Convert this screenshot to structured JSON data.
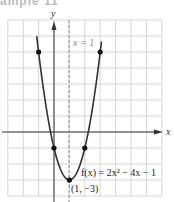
{
  "header_fragment": "ample 11",
  "chart_data": {
    "type": "line",
    "title": "",
    "xlabel": "x",
    "ylabel": "y",
    "xlim": [
      -3,
      7
    ],
    "ylim": [
      -4,
      7
    ],
    "grid": true,
    "series": [
      {
        "name": "f(x) = 2x^2 - 4x - 1",
        "function": "2x^2 - 4x - 1",
        "x": [
          -1.1,
          -1,
          0,
          1,
          2,
          3,
          3.1
        ],
        "y": [
          5.62,
          5,
          -1,
          -3,
          -1,
          5,
          5.82
        ]
      }
    ],
    "marked_points": [
      {
        "x": -1,
        "y": 5
      },
      {
        "x": 0,
        "y": -1
      },
      {
        "x": 1,
        "y": -3
      },
      {
        "x": 2,
        "y": -1
      },
      {
        "x": 3,
        "y": 5
      }
    ],
    "axis_of_symmetry": {
      "x": 1,
      "label": "x = 1",
      "style": "dashed"
    },
    "annotations": [
      {
        "text": "f(x) = 2x² − 4x − 1",
        "near": {
          "x": 1.3,
          "y": -2.4
        }
      },
      {
        "text": "(1, −3)",
        "near": {
          "x": 1,
          "y": -3.6
        }
      },
      {
        "text": "x = 1",
        "near": {
          "x": 1.6,
          "y": 5.6
        }
      }
    ],
    "colors": {
      "curve": "#333333",
      "grid": "#cccccc",
      "axis": "#333333",
      "symmetry": "#888888"
    }
  },
  "labels": {
    "x_axis": "x",
    "y_axis": "y",
    "symmetry": "x = 1",
    "function": "f(x) = 2x² − 4x − 1",
    "vertex": "(1, −3)"
  }
}
